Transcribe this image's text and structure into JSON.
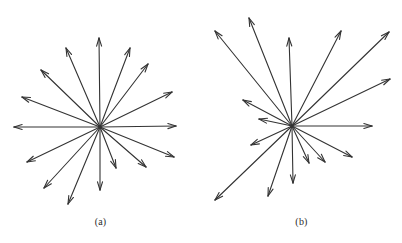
{
  "figure": {
    "background_color": "#ffffff",
    "stroke_color": "#333333",
    "caption_color": "#2b2b2b",
    "width": 402,
    "height": 243
  },
  "panels": [
    {
      "id": "a",
      "caption": "(a)",
      "caption_x": 100,
      "caption_y": 224,
      "center": {
        "x": 100,
        "y": 127
      },
      "description": "isotropic radial vector star",
      "arrow_count": 16,
      "arrows": [
        {
          "name": "arrow-up",
          "angle_deg": 90,
          "length": 89,
          "tip": {
            "x": 99,
            "y": 38
          }
        },
        {
          "name": "arrow-up-right-steep",
          "angle_deg": 69,
          "length": 85,
          "tip": {
            "x": 130,
            "y": 48
          }
        },
        {
          "name": "arrow-up-right-mid",
          "angle_deg": 53,
          "length": 79,
          "tip": {
            "x": 148,
            "y": 64
          }
        },
        {
          "name": "arrow-up-right-shallow",
          "angle_deg": 30,
          "length": 83,
          "tip": {
            "x": 172,
            "y": 92
          }
        },
        {
          "name": "arrow-right",
          "angle_deg": 1,
          "length": 76,
          "tip": {
            "x": 176,
            "y": 126
          }
        },
        {
          "name": "arrow-down-right-shallow",
          "angle_deg": -22,
          "length": 80,
          "tip": {
            "x": 174,
            "y": 157
          }
        },
        {
          "name": "arrow-down-right-mid",
          "angle_deg": -40,
          "length": 60,
          "tip": {
            "x": 146,
            "y": 167
          }
        },
        {
          "name": "arrow-down-right-steep",
          "angle_deg": -68,
          "length": 44,
          "tip": {
            "x": 116,
            "y": 168
          }
        },
        {
          "name": "arrow-down",
          "angle_deg": -90,
          "length": 63,
          "tip": {
            "x": 100,
            "y": 190
          }
        },
        {
          "name": "arrow-down-left-steep",
          "angle_deg": -113,
          "length": 84,
          "tip": {
            "x": 68,
            "y": 204
          }
        },
        {
          "name": "arrow-down-left-mid",
          "angle_deg": -132,
          "length": 83,
          "tip": {
            "x": 44,
            "y": 188
          }
        },
        {
          "name": "arrow-down-left-shallow",
          "angle_deg": -155,
          "length": 80,
          "tip": {
            "x": 27,
            "y": 162
          }
        },
        {
          "name": "arrow-left",
          "angle_deg": 180,
          "length": 86,
          "tip": {
            "x": 14,
            "y": 127
          }
        },
        {
          "name": "arrow-up-left-shallow",
          "angle_deg": 159,
          "length": 84,
          "tip": {
            "x": 22,
            "y": 97
          }
        },
        {
          "name": "arrow-up-left-mid",
          "angle_deg": 136,
          "length": 82,
          "tip": {
            "x": 41,
            "y": 70
          }
        },
        {
          "name": "arrow-up-left-steep",
          "angle_deg": 113,
          "length": 86,
          "tip": {
            "x": 66,
            "y": 48
          }
        }
      ]
    },
    {
      "id": "b",
      "caption": "(b)",
      "caption_x": 292,
      "caption_y": 224,
      "center": {
        "x": 292,
        "y": 126
      },
      "description": "anisotropic radial vector star with uneven angular spacing and lengths",
      "arrow_count": 16,
      "arrows": [
        {
          "name": "arrow-up",
          "angle_deg": 92,
          "length": 88,
          "tip": {
            "x": 289,
            "y": 38
          }
        },
        {
          "name": "arrow-up-right-steep",
          "angle_deg": 62,
          "length": 106,
          "tip": {
            "x": 341,
            "y": 31
          }
        },
        {
          "name": "arrow-up-right-mid",
          "angle_deg": 43,
          "length": 133,
          "tip": {
            "x": 389,
            "y": 32
          }
        },
        {
          "name": "arrow-up-right-shallow",
          "angle_deg": 24,
          "length": 107,
          "tip": {
            "x": 390,
            "y": 79
          }
        },
        {
          "name": "arrow-right",
          "angle_deg": 0,
          "length": 80,
          "tip": {
            "x": 372,
            "y": 126
          }
        },
        {
          "name": "arrow-down-right-shallow",
          "angle_deg": -27,
          "length": 68,
          "tip": {
            "x": 352,
            "y": 157
          }
        },
        {
          "name": "arrow-down-right-mid",
          "angle_deg": -47,
          "length": 49,
          "tip": {
            "x": 325,
            "y": 162
          }
        },
        {
          "name": "arrow-down-right-steep",
          "angle_deg": -66,
          "length": 41,
          "tip": {
            "x": 309,
            "y": 163
          }
        },
        {
          "name": "arrow-down",
          "angle_deg": -89,
          "length": 57,
          "tip": {
            "x": 293,
            "y": 183
          }
        },
        {
          "name": "arrow-down-left-steep",
          "angle_deg": -109,
          "length": 74,
          "tip": {
            "x": 268,
            "y": 196
          }
        },
        {
          "name": "arrow-down-left-mid",
          "angle_deg": -136,
          "length": 107,
          "tip": {
            "x": 215,
            "y": 200
          }
        },
        {
          "name": "arrow-down-left-shallow",
          "angle_deg": -155,
          "length": 45,
          "tip": {
            "x": 251,
            "y": 145
          }
        },
        {
          "name": "arrow-left-upper",
          "angle_deg": 168,
          "length": 33,
          "tip": {
            "x": 259,
            "y": 119
          }
        },
        {
          "name": "arrow-up-left-shallow",
          "angle_deg": 152,
          "length": 56,
          "tip": {
            "x": 243,
            "y": 100
          }
        },
        {
          "name": "arrow-up-left-mid",
          "angle_deg": 129,
          "length": 123,
          "tip": {
            "x": 215,
            "y": 31
          }
        },
        {
          "name": "arrow-up-left-steep",
          "angle_deg": 112,
          "length": 116,
          "tip": {
            "x": 249,
            "y": 18
          }
        }
      ]
    }
  ]
}
